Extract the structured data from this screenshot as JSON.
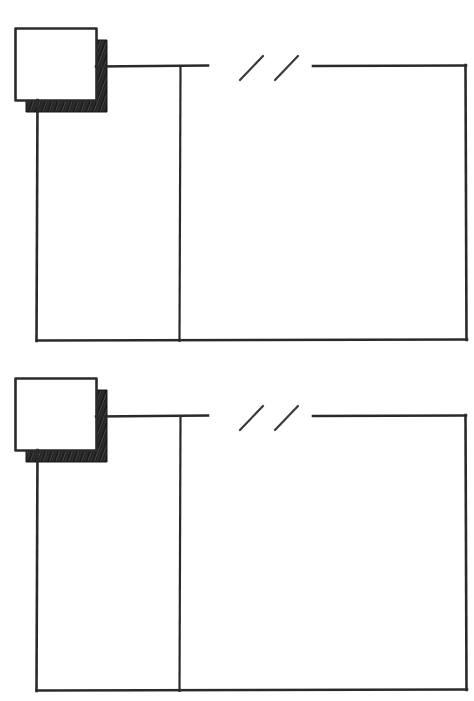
{
  "document": {
    "title": "Hand-drawn technical line diagram",
    "style": "pencil sketch on white paper",
    "width": 474,
    "height": 701,
    "background_color": "#ffffff",
    "ink_color": "#2b2b2b",
    "shadow_color": "#1c1c1c"
  },
  "figures": [
    {
      "id": "figure-top",
      "name": "upper-diagram",
      "label": "",
      "square": {
        "name": "shaded-square-top",
        "x": 15,
        "y": 28,
        "width": 81,
        "height": 72,
        "fill": "#ffffff",
        "stroke": "#2b2b2b",
        "shadow_offset_x": 11,
        "shadow_offset_y": 12,
        "shadow_fill": "#232323"
      },
      "outline": {
        "name": "outer-rectangle-top",
        "left": 37,
        "right": 466,
        "top": 66,
        "bottom": 340
      },
      "horizontal_segment_left": {
        "x1": 96,
        "x2": 208,
        "y": 66
      },
      "horizontal_segment_right": {
        "x1": 313,
        "x2": 466,
        "y": 66
      },
      "vertical_divider": {
        "x": 180,
        "y1": 66,
        "y2": 340
      },
      "vertical_left_edge": {
        "x": 37,
        "y1": 100,
        "y2": 340
      },
      "vertical_right_edge": {
        "x": 466,
        "y1": 66,
        "y2": 340
      },
      "bottom_edge": {
        "x1": 37,
        "x2": 466,
        "y": 340
      },
      "break_marks": [
        {
          "x1": 240,
          "y1": 80,
          "x2": 263,
          "y2": 56
        },
        {
          "x1": 275,
          "y1": 80,
          "x2": 298,
          "y2": 56
        }
      ]
    },
    {
      "id": "figure-bottom",
      "name": "lower-diagram",
      "label": "",
      "square": {
        "name": "shaded-square-bottom",
        "x": 15,
        "y": 378,
        "width": 81,
        "height": 72,
        "fill": "#ffffff",
        "stroke": "#2b2b2b",
        "shadow_offset_x": 11,
        "shadow_offset_y": 12,
        "shadow_fill": "#232323"
      },
      "outline": {
        "name": "outer-rectangle-bottom",
        "left": 37,
        "right": 466,
        "top": 416,
        "bottom": 690
      },
      "horizontal_segment_left": {
        "x1": 96,
        "x2": 208,
        "y": 416
      },
      "horizontal_segment_right": {
        "x1": 313,
        "x2": 466,
        "y": 416
      },
      "vertical_divider": {
        "x": 180,
        "y1": 416,
        "y2": 690
      },
      "vertical_left_edge": {
        "x": 37,
        "y1": 450,
        "y2": 690
      },
      "vertical_right_edge": {
        "x": 466,
        "y1": 416,
        "y2": 690
      },
      "bottom_edge": {
        "x1": 37,
        "x2": 466,
        "y": 690
      },
      "break_marks": [
        {
          "x1": 240,
          "y1": 430,
          "x2": 263,
          "y2": 406
        },
        {
          "x1": 275,
          "y1": 430,
          "x2": 298,
          "y2": 406
        }
      ]
    }
  ],
  "annotations": {
    "break_symbol_meaning": "omitted / truncated span",
    "visible_text": []
  }
}
